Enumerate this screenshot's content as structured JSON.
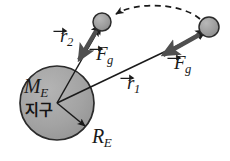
{
  "figure": {
    "background_color": "#ffffff",
    "width": 230,
    "height": 161
  },
  "colors": {
    "earth_fill": "#a3a3a3",
    "earth_stroke": "#2b2b2b",
    "satellite_fill": "#9e9e9e",
    "satellite_stroke": "#2b2b2b",
    "vector_line": "#1a1a1a",
    "force_vector": "#555555",
    "dashed_path": "#1a1a1a",
    "text": "#1a1a1a"
  },
  "earth": {
    "name": "earth-body",
    "center_x": 57,
    "center_y": 103,
    "radius": 37,
    "mass_label": {
      "symbol": "M",
      "subscript": "E"
    },
    "name_label": "지구",
    "radius_label": {
      "symbol": "R",
      "subscript": "E"
    }
  },
  "satellites": [
    {
      "name": "satellite-position-2",
      "cx": 102,
      "cy": 22,
      "r": 9
    },
    {
      "name": "satellite-position-1",
      "cx": 209,
      "cy": 27,
      "r": 10
    }
  ],
  "vectors": [
    {
      "name": "position-vector-r2",
      "kind": "position",
      "symbol": "r",
      "subscript": "2",
      "label_x": 60,
      "label_y": 26,
      "from": "earth-center",
      "to": "satellite-position-2"
    },
    {
      "name": "position-vector-r1",
      "kind": "position",
      "symbol": "r",
      "subscript": "1",
      "label_x": 127,
      "label_y": 73,
      "from": "earth-center",
      "to": "satellite-position-1"
    },
    {
      "name": "force-vector-fg-near",
      "kind": "force",
      "symbol": "F",
      "subscript": "g",
      "label_x": 96,
      "label_y": 44,
      "direction": "toward-earth"
    },
    {
      "name": "force-vector-fg-far",
      "kind": "force",
      "symbol": "F",
      "subscript": "g",
      "label_x": 174,
      "label_y": 53,
      "direction": "toward-earth"
    }
  ],
  "dashed_path": {
    "name": "orbital-transfer-path",
    "from": "satellite-position-1",
    "to": "satellite-position-2",
    "style": "dashed",
    "arrowhead": "at-destination"
  }
}
